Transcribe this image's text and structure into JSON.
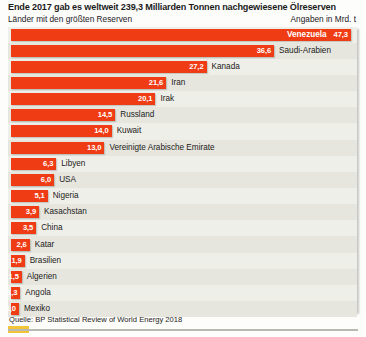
{
  "header": {
    "title": "Ende 2017 gab es weltweit 239,3 Milliarden Tonnen nachgewiesene Ölreserven",
    "subtitle": "Länder mit den größten Reserven",
    "units": "Angaben in Mrd. t"
  },
  "footer": {
    "source": "Quelle: BP Statistical Review of World Energy 2018"
  },
  "colors": {
    "bar": "#f03c14",
    "panel_background": "#efefe9",
    "band": "#e6e6df",
    "value_text": "#ffffff",
    "category_text": "#1c1a18",
    "accent_swatch": "#f2c43a",
    "rule": "#b9b9b2"
  },
  "chart_data": {
    "type": "bar",
    "orientation": "horizontal",
    "title": "Ende 2017 gab es weltweit 239,3 Milliarden Tonnen nachgewiesene Ölreserven",
    "subtitle": "Länder mit den größten Reserven",
    "xlabel": "Angaben in Mrd. t",
    "ylabel": "",
    "xlim": [
      0,
      47.3
    ],
    "grid": false,
    "legend": false,
    "world_total": "239,3",
    "categories": [
      "Venezuela",
      "Saudi-Arabien",
      "Kanada",
      "Iran",
      "Irak",
      "Russland",
      "Kuwait",
      "Vereinigte Arabische Emirate",
      "Libyen",
      "USA",
      "Nigeria",
      "Kasachstan",
      "China",
      "Katar",
      "Brasilien",
      "Algerien",
      "Angola",
      "Mexiko"
    ],
    "values": [
      47.3,
      36.6,
      27.2,
      21.6,
      20.1,
      14.5,
      14.0,
      13.0,
      6.3,
      6.0,
      5.1,
      3.9,
      3.5,
      2.6,
      1.9,
      1.5,
      1.3,
      1.0
    ],
    "value_labels": [
      "47,3",
      "36,6",
      "27,2",
      "21,6",
      "20,1",
      "14,5",
      "14,0",
      "13,0",
      "6,3",
      "6,0",
      "5,1",
      "3,9",
      "3,5",
      "2,6",
      "1,9",
      "1,5",
      "1,3",
      "1,0"
    ],
    "bars": [
      {
        "label": "Venezuela",
        "value": 47.3,
        "value_label": "47,3",
        "label_inside": true
      },
      {
        "label": "Saudi-Arabien",
        "value": 36.6,
        "value_label": "36,6",
        "label_inside": false
      },
      {
        "label": "Kanada",
        "value": 27.2,
        "value_label": "27,2",
        "label_inside": false
      },
      {
        "label": "Iran",
        "value": 21.6,
        "value_label": "21,6",
        "label_inside": false
      },
      {
        "label": "Irak",
        "value": 20.1,
        "value_label": "20,1",
        "label_inside": false
      },
      {
        "label": "Russland",
        "value": 14.5,
        "value_label": "14,5",
        "label_inside": false
      },
      {
        "label": "Kuwait",
        "value": 14.0,
        "value_label": "14,0",
        "label_inside": false
      },
      {
        "label": "Vereinigte Arabische Emirate",
        "value": 13.0,
        "value_label": "13,0",
        "label_inside": false
      },
      {
        "label": "Libyen",
        "value": 6.3,
        "value_label": "6,3",
        "label_inside": false
      },
      {
        "label": "USA",
        "value": 6.0,
        "value_label": "6,0",
        "label_inside": false
      },
      {
        "label": "Nigeria",
        "value": 5.1,
        "value_label": "5,1",
        "label_inside": false
      },
      {
        "label": "Kasachstan",
        "value": 3.9,
        "value_label": "3,9",
        "label_inside": false
      },
      {
        "label": "China",
        "value": 3.5,
        "value_label": "3,5",
        "label_inside": false
      },
      {
        "label": "Katar",
        "value": 2.6,
        "value_label": "2,6",
        "label_inside": false
      },
      {
        "label": "Brasilien",
        "value": 1.9,
        "value_label": "1,9",
        "label_inside": false
      },
      {
        "label": "Algerien",
        "value": 1.5,
        "value_label": "1,5",
        "label_inside": false
      },
      {
        "label": "Angola",
        "value": 1.3,
        "value_label": "1,3",
        "label_inside": false
      },
      {
        "label": "Mexiko",
        "value": 1.0,
        "value_label": "1,0",
        "label_inside": false
      }
    ]
  }
}
